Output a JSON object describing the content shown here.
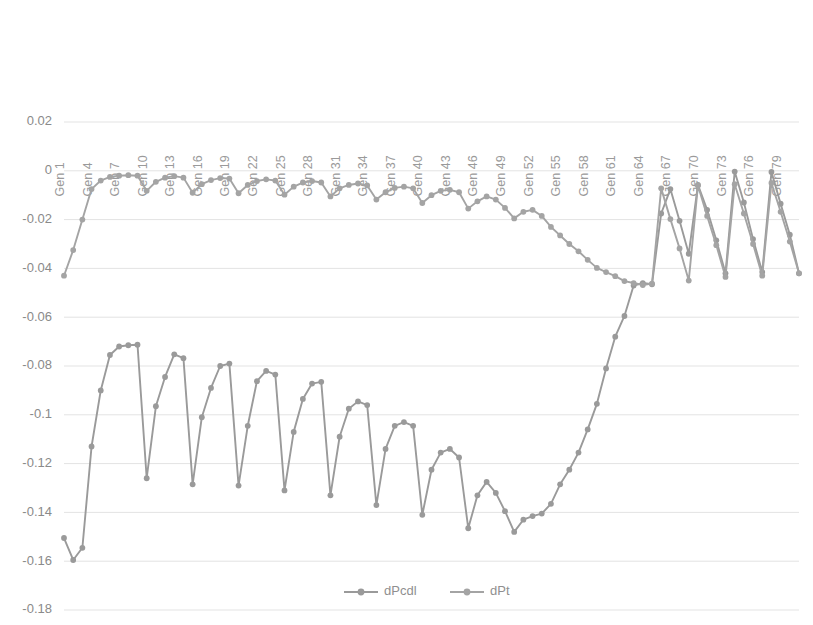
{
  "chart_data": {
    "type": "line",
    "title": "",
    "subtitle": "",
    "xlabel": "",
    "ylabel": "",
    "ylim": [
      -0.18,
      0.02
    ],
    "ytick_values": [
      0.02,
      0,
      -0.02,
      -0.04,
      -0.06,
      -0.08,
      -0.1,
      -0.12,
      -0.14,
      -0.16,
      -0.18
    ],
    "ytick_labels": [
      "0.02",
      "0",
      "-0.02",
      "-0.04",
      "-0.06",
      "-0.08",
      "-0.1",
      "-0.12",
      "-0.14",
      "-0.16",
      "-0.18"
    ],
    "grid": true,
    "grid_axis": "y",
    "legend_position": "bottom",
    "x_tick_interval": 3,
    "x_tick_labels": [
      "Gen 1",
      "Gen 4",
      "Gen 7",
      "Gen 10",
      "Gen 13",
      "Gen 16",
      "Gen 19",
      "Gen 22",
      "Gen 25",
      "Gen 28",
      "Gen 31",
      "Gen 34",
      "Gen 37",
      "Gen 40",
      "Gen 43",
      "Gen 46",
      "Gen 49",
      "Gen 52",
      "Gen 55",
      "Gen 58",
      "Gen 61",
      "Gen 64",
      "Gen 67",
      "Gen 70",
      "Gen 73",
      "Gen 76",
      "Gen 79"
    ],
    "x_label_prefix": "Gen ",
    "x_count": 81,
    "x": [
      1,
      2,
      3,
      4,
      5,
      6,
      7,
      8,
      9,
      10,
      11,
      12,
      13,
      14,
      15,
      16,
      17,
      18,
      19,
      20,
      21,
      22,
      23,
      24,
      25,
      26,
      27,
      28,
      29,
      30,
      31,
      32,
      33,
      34,
      35,
      36,
      37,
      38,
      39,
      40,
      41,
      42,
      43,
      44,
      45,
      46,
      47,
      48,
      49,
      50,
      51,
      52,
      53,
      54,
      55,
      56,
      57,
      58,
      59,
      60,
      61,
      62,
      63,
      64,
      65,
      66,
      67,
      68,
      69,
      70,
      71,
      72,
      73,
      74,
      75,
      76,
      77,
      78,
      79,
      80,
      81
    ],
    "series": [
      {
        "name": "dPcdl",
        "color": "#9a9a9a",
        "marker": "circle",
        "values": [
          -0.1505,
          -0.1595,
          -0.1545,
          -0.113,
          -0.09,
          -0.0755,
          -0.072,
          -0.0715,
          -0.0713,
          -0.126,
          -0.0965,
          -0.0845,
          -0.0752,
          -0.0768,
          -0.1285,
          -0.101,
          -0.089,
          -0.08,
          -0.079,
          -0.129,
          -0.1045,
          -0.0862,
          -0.082,
          -0.0835,
          -0.131,
          -0.107,
          -0.0935,
          -0.0872,
          -0.0865,
          -0.133,
          -0.109,
          -0.0975,
          -0.0945,
          -0.096,
          -0.137,
          -0.114,
          -0.1045,
          -0.103,
          -0.1045,
          -0.141,
          -0.1225,
          -0.1155,
          -0.114,
          -0.1175,
          -0.1465,
          -0.133,
          -0.1275,
          -0.132,
          -0.1395,
          -0.148,
          -0.143,
          -0.1415,
          -0.1405,
          -0.1365,
          -0.1285,
          -0.1225,
          -0.1155,
          -0.106,
          -0.0955,
          -0.081,
          -0.068,
          -0.0595,
          -0.047,
          -0.046,
          -0.0465,
          -0.0175,
          -0.0075,
          -0.0205,
          -0.034,
          -0.0058,
          -0.016,
          -0.0285,
          -0.042,
          -0.0003,
          -0.013,
          -0.028,
          -0.0415,
          -0.0005,
          -0.0135,
          -0.0262,
          -0.042
        ]
      },
      {
        "name": "dPt",
        "color": "#a4a4a4",
        "marker": "circle",
        "values": [
          -0.043,
          -0.0325,
          -0.02,
          -0.0075,
          -0.004,
          -0.0025,
          -0.002,
          -0.0018,
          -0.002,
          -0.0082,
          -0.0045,
          -0.0028,
          -0.0022,
          -0.0028,
          -0.009,
          -0.0055,
          -0.0038,
          -0.003,
          -0.0032,
          -0.0092,
          -0.0058,
          -0.0042,
          -0.0035,
          -0.004,
          -0.0098,
          -0.0065,
          -0.0048,
          -0.0042,
          -0.0048,
          -0.0105,
          -0.0072,
          -0.0058,
          -0.0052,
          -0.006,
          -0.0118,
          -0.0088,
          -0.007,
          -0.0065,
          -0.0072,
          -0.0132,
          -0.01,
          -0.0082,
          -0.0078,
          -0.0088,
          -0.0155,
          -0.0125,
          -0.0105,
          -0.0118,
          -0.0152,
          -0.0195,
          -0.0168,
          -0.016,
          -0.0185,
          -0.023,
          -0.0265,
          -0.03,
          -0.033,
          -0.0365,
          -0.0398,
          -0.0415,
          -0.0432,
          -0.0452,
          -0.046,
          -0.0468,
          -0.0462,
          -0.0072,
          -0.0198,
          -0.0318,
          -0.045,
          -0.006,
          -0.0185,
          -0.0305,
          -0.0435,
          -0.0055,
          -0.0175,
          -0.03,
          -0.043,
          -0.005,
          -0.0168,
          -0.029,
          -0.042
        ]
      }
    ]
  },
  "legend": {
    "items": [
      {
        "label": "dPcdl"
      },
      {
        "label": "dPt"
      }
    ]
  },
  "colors": {
    "series_1": "#9a9a9a",
    "series_2": "#a4a4a4",
    "gridline": "#e3e3e3",
    "tick_text": "#8a8a8a",
    "background": "#ffffff"
  }
}
